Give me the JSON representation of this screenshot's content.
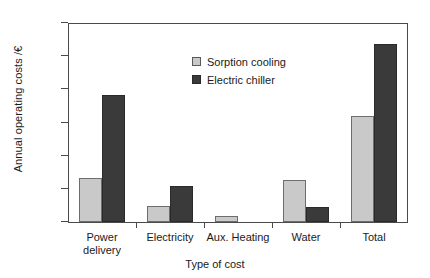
{
  "chart_data": {
    "type": "bar",
    "title": "",
    "xlabel": "Type of cost",
    "ylabel": "Annual operating costs /€",
    "categories": [
      "Power\ndelivery",
      "Electricity",
      "Aux. Heating",
      "Water",
      "Total"
    ],
    "yticks": [
      0,
      1000,
      2000,
      3000,
      4000,
      5000,
      6000
    ],
    "ylim": [
      0,
      6000
    ],
    "grid": false,
    "legend_position": "upper-center",
    "series": [
      {
        "name": "Sorption cooling",
        "color": "#c9c9c9",
        "values": [
          1320,
          480,
          170,
          1270,
          3200
        ]
      },
      {
        "name": "Electric chiller",
        "color": "#3a3a3a",
        "values": [
          3830,
          1090,
          0,
          450,
          5365
        ]
      }
    ]
  }
}
